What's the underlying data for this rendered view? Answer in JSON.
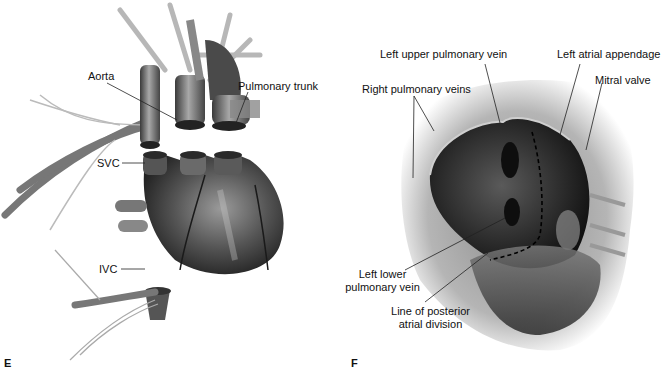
{
  "panels": [
    {
      "letter": "E",
      "description": "Explanted heart with transected great vessels",
      "labels": {
        "aorta": "Aorta",
        "pulmonary_trunk": "Pulmonary trunk",
        "svc": "SVC",
        "ivc": "IVC"
      }
    },
    {
      "letter": "F",
      "description": "Opened left atrium viewed from surgeon's perspective",
      "labels": {
        "left_upper_pulmonary_vein": "Left upper pulmonary vein",
        "left_atrial_appendage": "Left atrial appendage",
        "right_pulmonary_veins": "Right pulmonary veins",
        "mitral_valve": "Mitral valve",
        "left_lower_pulmonary_vein_1": "Left lower",
        "left_lower_pulmonary_vein_2": "pulmonary vein",
        "line_of_posterior_1": "Line of posterior",
        "line_of_posterior_2": "atrial division"
      }
    }
  ],
  "colors": {
    "background": "#ffffff",
    "label_text": "#111111",
    "leader_line": "#222222",
    "tissue_dark": "#2a2a2a",
    "tissue_mid": "#6e6e6e",
    "tissue_light": "#bdbdbd"
  }
}
